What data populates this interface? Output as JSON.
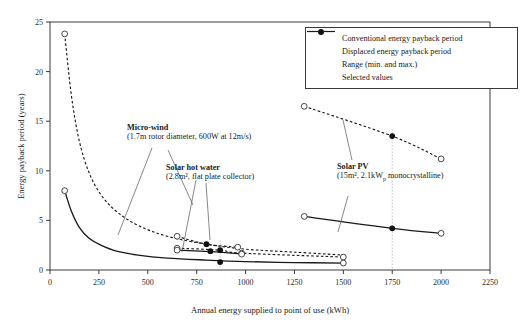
{
  "chart_data": {
    "type": "line",
    "title": "",
    "xlabel": "Annual energy supplied to point of use (kWh)",
    "ylabel": "Energy payback period (years)",
    "xlim": [
      0,
      2250
    ],
    "ylim": [
      0,
      25
    ],
    "xticks": [
      0,
      250,
      500,
      750,
      1000,
      1250,
      1500,
      1750,
      2000,
      2250
    ],
    "yticks": [
      0,
      5,
      10,
      15,
      20,
      25
    ],
    "grid": false,
    "legend_position": "top-right",
    "legend": [
      {
        "key": "conventional",
        "label": "Conventional energy payback period",
        "style": "dashed-line"
      },
      {
        "key": "displaced",
        "label": "Displaced energy payback period",
        "style": "solid-line"
      },
      {
        "key": "range",
        "label": "Range (min. and max.)",
        "style": "open-circle"
      },
      {
        "key": "selected",
        "label": "Selected values",
        "style": "filled-circle"
      }
    ],
    "annotations": [
      {
        "key": "micro-wind",
        "heading": "Micro-wind",
        "sub": "(1.7m rotor diameter, 600W at 12m/s)"
      },
      {
        "key": "solar-hot-water",
        "heading": "Solar hot water",
        "sub": "(2.8m², flat plate collector)"
      },
      {
        "key": "solar-pv",
        "heading": "Solar PV",
        "sub_pre": "(15m², 2.1kW",
        "sub_sup": "p",
        "sub_post": " monocrystalline)"
      }
    ],
    "series": [
      {
        "name": "Micro-wind conventional",
        "technology": "micro-wind",
        "style": "dashed",
        "points": [
          [
            75,
            23.8
          ],
          [
            110,
            17.5
          ],
          [
            150,
            13.0
          ],
          [
            200,
            9.8
          ],
          [
            260,
            7.6
          ],
          [
            340,
            5.9
          ],
          [
            450,
            4.5
          ],
          [
            600,
            3.4
          ],
          [
            800,
            2.6
          ],
          [
            1000,
            2.1
          ],
          [
            1250,
            1.8
          ],
          [
            1500,
            1.5
          ]
        ]
      },
      {
        "name": "Micro-wind displaced",
        "technology": "micro-wind",
        "style": "solid",
        "points": [
          [
            75,
            8.0
          ],
          [
            110,
            5.9
          ],
          [
            150,
            4.3
          ],
          [
            200,
            3.2
          ],
          [
            260,
            2.5
          ],
          [
            340,
            1.9
          ],
          [
            450,
            1.5
          ],
          [
            600,
            1.2
          ],
          [
            800,
            1.0
          ],
          [
            1000,
            0.85
          ],
          [
            1250,
            0.75
          ],
          [
            1500,
            0.7
          ]
        ]
      },
      {
        "name": "Solar hot water conventional",
        "technology": "solar-hot-water",
        "style": "dashed",
        "points": [
          [
            650,
            3.4
          ],
          [
            800,
            2.6
          ],
          [
            960,
            2.3
          ]
        ]
      },
      {
        "name": "Solar hot water conventional lower",
        "technology": "solar-hot-water",
        "style": "dashed",
        "points": [
          [
            650,
            2.2
          ],
          [
            870,
            2.0
          ],
          [
            980,
            1.7
          ],
          [
            1500,
            1.3
          ]
        ]
      },
      {
        "name": "Solar hot water displaced",
        "technology": "solar-hot-water",
        "style": "solid",
        "points": [
          [
            650,
            2.0
          ],
          [
            870,
            1.8
          ],
          [
            980,
            1.6
          ]
        ]
      },
      {
        "name": "Solar PV conventional",
        "technology": "solar-pv",
        "style": "dashed",
        "points": [
          [
            1300,
            16.5
          ],
          [
            1750,
            13.5
          ],
          [
            2000,
            11.2
          ]
        ]
      },
      {
        "name": "Solar PV displaced",
        "technology": "solar-pv",
        "style": "solid",
        "points": [
          [
            1300,
            5.4
          ],
          [
            1750,
            4.2
          ],
          [
            2000,
            3.7
          ]
        ]
      }
    ],
    "range_markers": [
      {
        "technology": "micro-wind",
        "x": 75,
        "y": 23.8
      },
      {
        "technology": "micro-wind",
        "x": 75,
        "y": 8.0
      },
      {
        "technology": "solar-hot-water",
        "x": 650,
        "y": 3.4
      },
      {
        "technology": "solar-hot-water",
        "x": 650,
        "y": 2.2
      },
      {
        "technology": "solar-hot-water",
        "x": 650,
        "y": 2.0
      },
      {
        "technology": "solar-hot-water",
        "x": 960,
        "y": 2.3
      },
      {
        "technology": "solar-hot-water",
        "x": 980,
        "y": 1.7
      },
      {
        "technology": "solar-hot-water",
        "x": 980,
        "y": 1.6
      },
      {
        "technology": "micro-wind",
        "x": 1500,
        "y": 1.3
      },
      {
        "technology": "micro-wind",
        "x": 1500,
        "y": 0.7
      },
      {
        "technology": "solar-pv",
        "x": 1300,
        "y": 16.5
      },
      {
        "technology": "solar-pv",
        "x": 2000,
        "y": 11.2
      },
      {
        "technology": "solar-pv",
        "x": 1300,
        "y": 5.4
      },
      {
        "technology": "solar-pv",
        "x": 2000,
        "y": 3.7
      }
    ],
    "selected_markers": [
      {
        "technology": "solar-hot-water",
        "x": 800,
        "y": 2.6
      },
      {
        "technology": "solar-hot-water",
        "x": 820,
        "y": 1.9
      },
      {
        "technology": "solar-hot-water",
        "x": 870,
        "y": 2.0
      },
      {
        "technology": "solar-hot-water",
        "x": 870,
        "y": 0.8
      },
      {
        "technology": "solar-pv",
        "x": 1750,
        "y": 13.5
      },
      {
        "technology": "solar-pv",
        "x": 1750,
        "y": 4.2
      }
    ],
    "colors": {
      "axis": "#3a3a3a",
      "line": "#1a1a1a",
      "marker_fill": "#111111",
      "marker_edge": "#333333",
      "background": "#ffffff"
    }
  }
}
